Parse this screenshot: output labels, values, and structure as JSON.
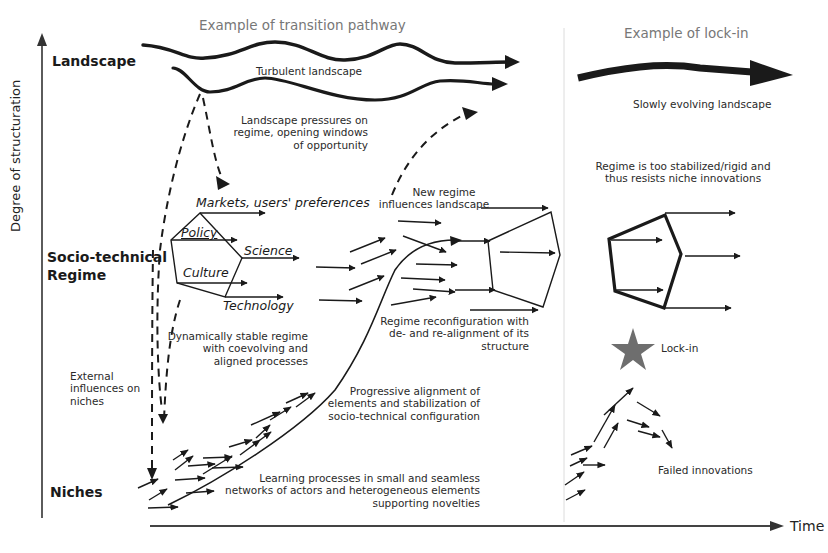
{
  "axes": {
    "y_label": "Degree of structuration",
    "x_label": "Time"
  },
  "levels": {
    "landscape": "Landscape",
    "regime_line1": "Socio-technical",
    "regime_line2": "Regime",
    "niches": "Niches"
  },
  "panels": {
    "transition": {
      "title": "Example of transition pathway",
      "turbulent_landscape": "Turbulent landscape",
      "landscape_pressures": [
        "Landscape pressures on",
        "regime, opening windows",
        "of opportunity"
      ],
      "regime_elements": {
        "markets": "Markets, users' preferences",
        "policy": "Policy",
        "science": "Science",
        "culture": "Culture",
        "technology": "Technology"
      },
      "dynamically_stable": [
        "Dynamically stable regime",
        "with coevolving and",
        "aligned processes"
      ],
      "external_influences": [
        "External",
        "influences on",
        "niches"
      ],
      "new_regime": [
        "New regime",
        "influences landscape"
      ],
      "reconfiguration": [
        "Regime reconfiguration with",
        "de- and re-alignment of its",
        "structure"
      ],
      "progressive_alignment": [
        "Progressive alignment of",
        "elements and stabilization of",
        "socio-technical configuration"
      ],
      "learning_processes": [
        "Learning processes in small and seamless",
        "networks of actors and heterogeneous elements",
        "supporting novelties"
      ]
    },
    "lockin": {
      "title": "Example of lock-in",
      "slowly_evolving": "Slowly evolving landscape",
      "regime_rigid": [
        "Regime is too stabilized/rigid and",
        "thus resists niche innovations"
      ],
      "lock_in": "Lock-in",
      "failed_innovations": "Failed innovations"
    }
  },
  "colors": {
    "ink": "#1a1a1a",
    "heading_gray": "#777777",
    "star_gray": "#6e6e6e",
    "divider": "#d8d8d8"
  },
  "icons": {
    "lock_in_marker": "star-icon"
  }
}
